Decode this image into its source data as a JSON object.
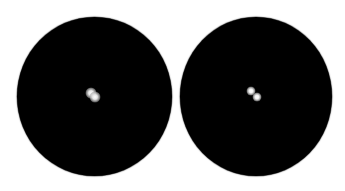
{
  "figure": {
    "background_color": "#ffffff",
    "field_color": "#000000",
    "point_color": "#ffffff",
    "panels": [
      {
        "id": "left",
        "state": "unresolved",
        "center": [
          94,
          96
        ],
        "points": [
          {
            "x": 91,
            "y": 93
          },
          {
            "x": 95,
            "y": 97
          }
        ]
      },
      {
        "id": "right",
        "state": "resolved",
        "center": [
          256,
          96
        ],
        "points": [
          {
            "x": 251,
            "y": 91
          },
          {
            "x": 257,
            "y": 97
          }
        ]
      }
    ]
  }
}
